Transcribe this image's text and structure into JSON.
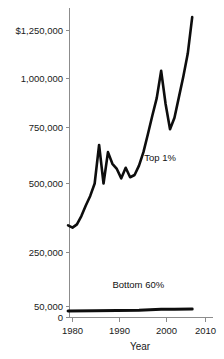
{
  "chart_data": {
    "type": "line",
    "title": "",
    "xlabel": "Year",
    "ylabel": "",
    "xlim": [
      1978.5,
      2010.6
    ],
    "ylim": [
      0,
      1340000
    ],
    "grid": false,
    "legend_position": "inline-annotations",
    "y_axis_note": "broken / non-linear axis: 0 and 50,000 compressed near the baseline, then 250,000 increments",
    "xticks": [
      1980,
      1990,
      2000,
      2010
    ],
    "xtick_labels": [
      "1980",
      "1990",
      "2000",
      "2010"
    ],
    "yticks": [
      0,
      50000,
      250000,
      500000,
      750000,
      1000000,
      1250000
    ],
    "ytick_labels": [
      "0",
      "50,000",
      "250,000",
      "500,000",
      "750,000",
      "1,000,000",
      "$1,250,000"
    ],
    "series": [
      {
        "name": "Top 1%",
        "label": "Top 1%",
        "x": [
          1979,
          1980,
          1981,
          1982,
          1983,
          1984,
          1985,
          1986,
          1987,
          1988,
          1989,
          1990,
          1991,
          1992,
          1993,
          1994,
          1995,
          1996,
          1997,
          1998,
          1999,
          2000,
          2001,
          2002,
          2003,
          2004,
          2005,
          2006,
          2007
        ],
        "values": [
          348000,
          340000,
          352000,
          382000,
          420000,
          455000,
          500000,
          672000,
          500000,
          640000,
          588000,
          565000,
          523000,
          570000,
          528000,
          538000,
          580000,
          640000,
          720000,
          810000,
          900000,
          1040000,
          870000,
          742000,
          800000,
          905000,
          1010000,
          1130000,
          1320000
        ],
        "color": "#0d0d0d"
      },
      {
        "name": "Bottom 60%",
        "label": "Bottom 60%",
        "x": [
          1979,
          1985,
          1990,
          1995,
          2000,
          2003,
          2007
        ],
        "values": [
          30000,
          31000,
          32000,
          33000,
          37000,
          37500,
          39000
        ],
        "color": "#0d0d0d"
      }
    ],
    "annotations": [
      {
        "text": "Top 1%",
        "x": 1996.2,
        "y": 600000
      },
      {
        "text": "Bottom 60%",
        "x": 1989.0,
        "y": 120000
      }
    ]
  }
}
